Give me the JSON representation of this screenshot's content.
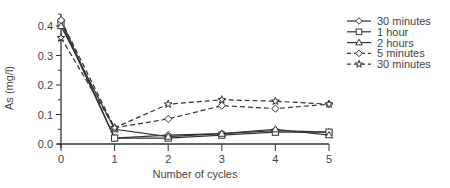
{
  "chart_data": {
    "type": "line",
    "title": "",
    "xlabel": "Number of cycles",
    "ylabel": "As (mg/l)",
    "x": [
      0,
      1,
      2,
      3,
      4,
      5
    ],
    "xticks": [
      "0",
      "1",
      "2",
      "3",
      "4",
      "5"
    ],
    "yticks": [
      "0.0",
      "0.1",
      "0.2",
      "0.3",
      "0.4"
    ],
    "ylim": [
      0,
      0.44
    ],
    "xlim": [
      0,
      5
    ],
    "grid": false,
    "legend_position": "right",
    "series": [
      {
        "name": "30 minutes",
        "line": "solid",
        "marker": "diamond",
        "values": [
          0.42,
          0.02,
          0.03,
          0.035,
          0.045,
          0.04
        ]
      },
      {
        "name": "1 hour",
        "line": "solid",
        "marker": "square",
        "values": [
          0.41,
          0.02,
          0.02,
          0.03,
          0.04,
          0.04
        ]
      },
      {
        "name": "2 hours",
        "line": "solid",
        "marker": "triangle",
        "values": [
          0.4,
          0.05,
          0.025,
          0.035,
          0.05,
          0.03
        ]
      },
      {
        "name": "5 minutes",
        "line": "dashed",
        "marker": "diamond",
        "values": [
          0.42,
          0.055,
          0.085,
          0.13,
          0.12,
          0.135
        ]
      },
      {
        "name": "30 minutes",
        "line": "dashed",
        "marker": "star",
        "values": [
          0.36,
          0.055,
          0.135,
          0.15,
          0.145,
          0.135
        ]
      }
    ]
  },
  "legend": {
    "items": [
      {
        "label": "30 minutes"
      },
      {
        "label": "1 hour"
      },
      {
        "label": "2 hours"
      },
      {
        "label": "5 minutes"
      },
      {
        "label": "30 minutes"
      }
    ]
  },
  "colors": {
    "line": "#333333",
    "axis": "#333333",
    "marker_fill": "#ffffff"
  }
}
